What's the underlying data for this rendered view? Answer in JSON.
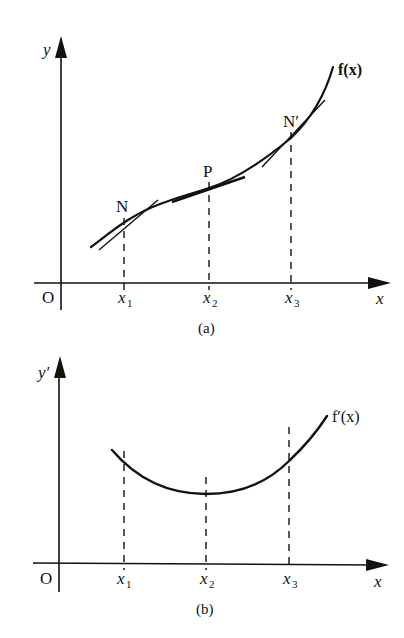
{
  "panel_a": {
    "caption": "(a)",
    "y_axis_label": "y",
    "x_axis_label": "x",
    "origin_label": "O",
    "curve_label": "f(x)",
    "ticks": [
      {
        "base": "x",
        "sub": "1"
      },
      {
        "base": "x",
        "sub": "2"
      },
      {
        "base": "x",
        "sub": "3"
      }
    ],
    "points": [
      {
        "label": "N",
        "at": "x1"
      },
      {
        "label": "P",
        "at": "x2"
      },
      {
        "label": "N′",
        "at": "x3"
      }
    ]
  },
  "panel_b": {
    "caption": "(b)",
    "y_axis_label": "y′",
    "x_axis_label": "x",
    "origin_label": "O",
    "curve_label": "f′(x)",
    "ticks": [
      {
        "base": "x",
        "sub": "1"
      },
      {
        "base": "x",
        "sub": "2"
      },
      {
        "base": "x",
        "sub": "3"
      }
    ]
  },
  "colors": {
    "ink": "#111111",
    "background": "#ffffff"
  }
}
